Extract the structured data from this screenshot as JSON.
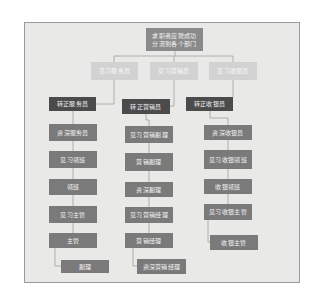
{
  "diagram": {
    "type": "career-path-flowchart",
    "root": {
      "label": "求职者应聘成功\n分流到各个部门"
    },
    "trainee_row": [
      {
        "label": "见习服务员"
      },
      {
        "label": "见习营销员"
      },
      {
        "label": "见习收银员"
      }
    ],
    "columns": [
      {
        "name": "service",
        "head": "转正服务员",
        "steps": [
          "资深服务员",
          "见习领班",
          "领班",
          "见习主管",
          "主管"
        ],
        "final": "副理"
      },
      {
        "name": "sales",
        "head": "转正营销员",
        "steps": [
          "见习营销副理",
          "营销副理",
          "资深副理",
          "见习营销经理",
          "营销经理"
        ],
        "final": "资深营销经理"
      },
      {
        "name": "cashier",
        "head": "转正收银员",
        "steps": [
          "资深收银员",
          "见习收银领班",
          "收银领班",
          "见习收银主管"
        ],
        "final": "收银主管"
      }
    ],
    "colors": {
      "frame_bg": "#e9e9e7",
      "root_box": "#8a8a8a",
      "trainee_box": "#d2d2d2",
      "regular_box": "#4b4b4b",
      "step_box": "#7a7a7a",
      "connector": "#9e9e9e"
    }
  }
}
